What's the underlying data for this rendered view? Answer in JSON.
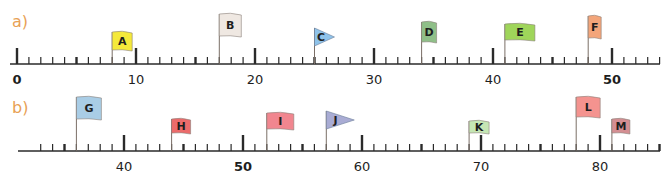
{
  "parts": [
    {
      "label": "a)",
      "axis": {
        "start": 0,
        "end": 54,
        "origin_value": 0,
        "origin_x": 17,
        "px_per_unit": 11.9,
        "y": 64,
        "line_x1": 10,
        "line_x2": 660
      },
      "tick_labels": [
        {
          "value": 0,
          "text": "0",
          "bold": true
        },
        {
          "value": 10,
          "text": "10",
          "bold": false
        },
        {
          "value": 20,
          "text": "20",
          "bold": false
        },
        {
          "value": 30,
          "text": "30",
          "bold": false
        },
        {
          "value": 40,
          "text": "40",
          "bold": false
        },
        {
          "value": 50,
          "text": "50",
          "bold": true
        }
      ],
      "flags": [
        {
          "letter": "A",
          "value": 8,
          "color": "#f5e93a",
          "shape": "rect",
          "pole": 32,
          "h": 18,
          "w": 20
        },
        {
          "letter": "B",
          "value": 17,
          "color": "#efe8e2",
          "shape": "rect",
          "pole": 50,
          "h": 22,
          "w": 22
        },
        {
          "letter": "C",
          "value": 25,
          "color": "#8fc3ea",
          "shape": "triangle",
          "pole": 36,
          "h": 18,
          "w": 20
        },
        {
          "letter": "D",
          "value": 34,
          "color": "#8fbf88",
          "shape": "rect",
          "pole": 42,
          "h": 20,
          "w": 15
        },
        {
          "letter": "E",
          "value": 41,
          "color": "#9fd55a",
          "shape": "rect",
          "pole": 40,
          "h": 16,
          "w": 30
        },
        {
          "letter": "F",
          "value": 48,
          "color": "#f3a57a",
          "shape": "rect",
          "pole": 48,
          "h": 22,
          "w": 13
        }
      ]
    },
    {
      "label": "b)",
      "axis": {
        "start": 33,
        "end": 86,
        "origin_value": 40,
        "origin_x": 124,
        "px_per_unit": 11.9,
        "y": 151,
        "line_x1": 18,
        "line_x2": 660
      },
      "tick_labels": [
        {
          "value": 40,
          "text": "40",
          "bold": false
        },
        {
          "value": 50,
          "text": "50",
          "bold": true
        },
        {
          "value": 60,
          "text": "60",
          "bold": false
        },
        {
          "value": 70,
          "text": "70",
          "bold": false
        },
        {
          "value": 80,
          "text": "80",
          "bold": false
        }
      ],
      "flags": [
        {
          "letter": "G",
          "value": 36,
          "color": "#a9cde6",
          "shape": "rect",
          "pole": 54,
          "h": 22,
          "w": 25
        },
        {
          "letter": "H",
          "value": 44,
          "color": "#ec6b6b",
          "shape": "rect",
          "pole": 32,
          "h": 14,
          "w": 19
        },
        {
          "letter": "I",
          "value": 52,
          "color": "#f1868f",
          "shape": "rect",
          "pole": 38,
          "h": 16,
          "w": 27
        },
        {
          "letter": "J",
          "value": 57,
          "color": "#a9acd4",
          "shape": "triangle",
          "pole": 40,
          "h": 18,
          "w": 28
        },
        {
          "letter": "K",
          "value": 69,
          "color": "#c5e6b4",
          "shape": "rect",
          "pole": 30,
          "h": 12,
          "w": 20
        },
        {
          "letter": "L",
          "value": 78,
          "color": "#f4938f",
          "shape": "rect",
          "pole": 54,
          "h": 20,
          "w": 24
        },
        {
          "letter": "M",
          "value": 81,
          "color": "#d48e92",
          "shape": "rect",
          "pole": 32,
          "h": 14,
          "w": 18
        }
      ]
    }
  ],
  "colors": {
    "axis": "#2a2a2a",
    "label": "#e8a155",
    "pole": "#7a6e66",
    "text": "#1e1e1e"
  }
}
